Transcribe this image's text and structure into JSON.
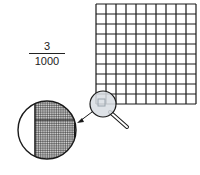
{
  "fraction": {
    "numerator": "3",
    "denominator": "1000"
  },
  "grid": {
    "rows": 10,
    "cols": 10
  },
  "magnified_grid": {
    "rows": 10,
    "cols": 10
  },
  "icons": [
    "magnifying-glass-icon",
    "arrow-icon"
  ],
  "colors": {
    "line": "#1a1a1a",
    "lens": "#d8dde3",
    "shade": "#9aa4ad"
  }
}
